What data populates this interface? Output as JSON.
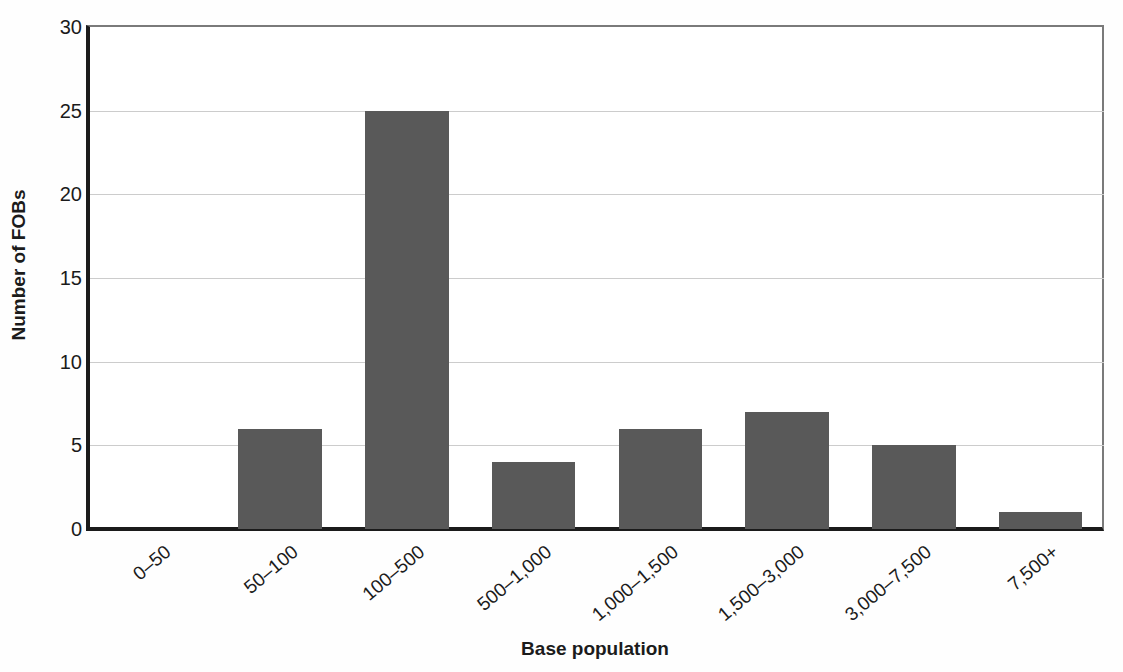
{
  "chart_data": {
    "type": "bar",
    "title": "",
    "categories": [
      "0–50",
      "50–100",
      "100–500",
      "500–1,000",
      "1,000–1,500",
      "1,500–3,000",
      "3,000–7,500",
      "7,500+"
    ],
    "values": [
      0,
      6,
      25,
      4,
      6,
      7,
      5,
      1
    ],
    "xlabel": "Base population",
    "ylabel": "Number of FOBs",
    "ylim": [
      0,
      30
    ],
    "yticks": [
      0,
      5,
      10,
      15,
      20,
      25,
      30
    ],
    "grid": "horizontal",
    "legend": "none",
    "bar_width_fraction": 0.66,
    "colors": {
      "bar": "#595959",
      "axis": "#1b1b1b",
      "border": "#7a7a7a",
      "gridline": "#cccccc",
      "text": "#1b1b1b",
      "background": "#ffffff"
    }
  }
}
